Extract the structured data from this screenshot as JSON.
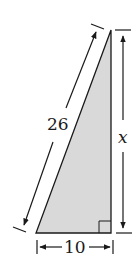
{
  "diagram": {
    "type": "right-triangle",
    "fill_color": "#d9d9d9",
    "stroke_color": "#1a1a1a",
    "labels": {
      "hypotenuse": "26",
      "vertical_leg": "x",
      "base": "10"
    },
    "right_angle_marker": true
  }
}
